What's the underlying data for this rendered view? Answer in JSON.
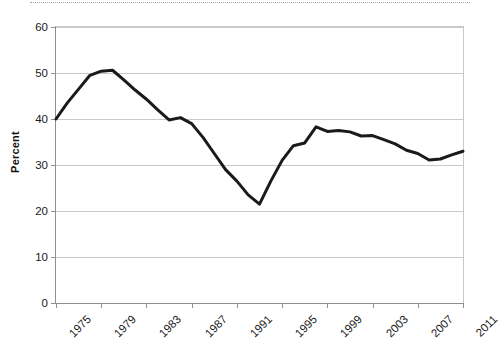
{
  "figure": {
    "top_rule": "dotted-rule",
    "background_color": "#ffffff"
  },
  "chart_data": {
    "type": "line",
    "title": "",
    "subtitle": "",
    "xlabel": "",
    "ylabel": "Percent",
    "ylim": [
      0,
      60
    ],
    "xlim": [
      1975,
      2011
    ],
    "grid": true,
    "legend": false,
    "legend_position": "none",
    "line_color": "#1a1a1a",
    "line_width_px": 3,
    "y_ticks": [
      0,
      10,
      20,
      30,
      40,
      50,
      60
    ],
    "y_tick_labels": [
      "0",
      "10",
      "20",
      "30",
      "40",
      "50",
      "60"
    ],
    "x_ticks": [
      1975,
      1979,
      1983,
      1987,
      1991,
      1995,
      1999,
      2003,
      2007,
      2011
    ],
    "x_tick_labels": [
      "1975",
      "1979",
      "1983",
      "1987",
      "1991",
      "1995",
      "1999",
      "2003",
      "2007",
      "2011"
    ],
    "x_tick_label_rotation_deg": -45,
    "series": [
      {
        "name": "Percent",
        "x": [
          1975,
          1976,
          1977,
          1978,
          1979,
          1980,
          1981,
          1982,
          1983,
          1984,
          1985,
          1986,
          1987,
          1988,
          1989,
          1990,
          1991,
          1992,
          1993,
          1994,
          1995,
          1996,
          1997,
          1998,
          1999,
          2000,
          2001,
          2002,
          2003,
          2004,
          2005,
          2006,
          2007,
          2008,
          2009,
          2010,
          2011
        ],
        "values": [
          40.0,
          43.5,
          46.5,
          49.5,
          50.4,
          50.6,
          48.5,
          46.3,
          44.3,
          42.0,
          39.8,
          40.3,
          39.0,
          36.0,
          32.5,
          29.0,
          26.5,
          23.5,
          21.5,
          26.5,
          31.0,
          34.2,
          34.8,
          38.3,
          37.3,
          37.5,
          37.2,
          36.3,
          36.4,
          35.5,
          34.6,
          33.2,
          32.5,
          31.1,
          31.3,
          32.2,
          33.0
        ]
      }
    ],
    "series_extra_points": {
      "note_last_value": 35.8
    }
  }
}
